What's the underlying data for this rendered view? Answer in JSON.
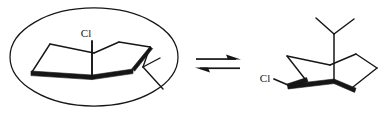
{
  "figure": {
    "type": "chemical-equilibrium-scheme",
    "stroke_color": "#161616",
    "background_color": "#ffffff",
    "bold_bond_width": 4.2,
    "thin_bond_width": 1.3
  },
  "left_structure": {
    "name": "axial-chlorine-chair-conformer",
    "highlight": {
      "shape": "ellipse",
      "name": "selection-ellipse",
      "cx": 94,
      "cy": 57,
      "rx": 84,
      "ry": 49
    },
    "substituent_label": "Cl",
    "substituent_position": "axial",
    "isopropyl_position": "equatorial",
    "ring_vertices": [
      {
        "x": 32,
        "y": 72
      },
      {
        "x": 50,
        "y": 45
      },
      {
        "x": 94,
        "y": 52
      },
      {
        "x": 118,
        "y": 43
      },
      {
        "x": 150,
        "y": 47
      },
      {
        "x": 133,
        "y": 73
      }
    ],
    "chlorine_label_x": 70,
    "chlorine_label_y": 31
  },
  "right_structure": {
    "name": "equatorial-chlorine-chair-conformer",
    "substituent_label": "Cl",
    "substituent_position": "equatorial",
    "isopropyl_position": "axial",
    "chlorine_label_x": 263,
    "chlorine_label_y": 80,
    "ring_vertices": [
      {
        "x": 289,
        "y": 56
      },
      {
        "x": 332,
        "y": 64
      },
      {
        "x": 357,
        "y": 54
      },
      {
        "x": 377,
        "y": 68
      },
      {
        "x": 336,
        "y": 88
      },
      {
        "x": 307,
        "y": 80
      }
    ]
  },
  "equilibrium_arrows": {
    "name": "equilibrium-double-arrow",
    "forward": {
      "x1": 196,
      "y1": 59,
      "x2": 241,
      "y2": 59,
      "direction": "right"
    },
    "reverse": {
      "x1": 196,
      "y1": 68,
      "x2": 241,
      "y2": 68,
      "direction": "left"
    }
  }
}
